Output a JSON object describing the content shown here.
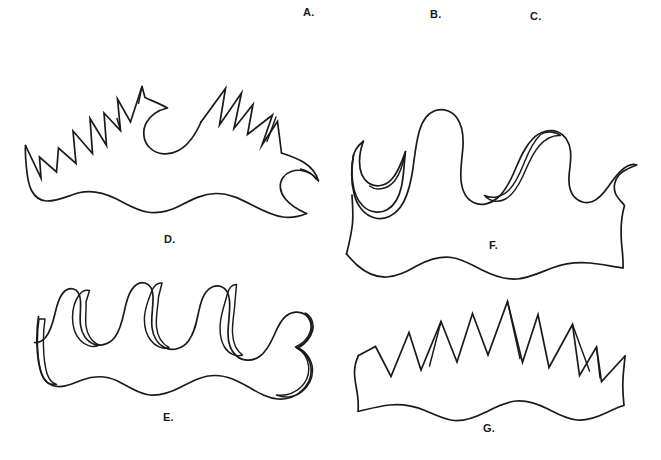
{
  "plate": {
    "background_color": "#ffffff",
    "ink_color": "#1a1a1a",
    "width": 661,
    "height": 460,
    "caption_font_size": 11
  },
  "header_labels": [
    {
      "id": "A",
      "text": "A.",
      "x": 303,
      "y": 7
    },
    {
      "id": "B",
      "text": "B.",
      "x": 430,
      "y": 9
    },
    {
      "id": "C",
      "text": "C.",
      "x": 530,
      "y": 11
    }
  ],
  "figures": [
    {
      "id": "D",
      "label": "D.",
      "label_x": 164,
      "label_y": 234,
      "margin_type": "sharply-serrate",
      "lobe_count": 9,
      "outline_style": "angular-spiked",
      "base_edge": "undulate",
      "bounds": {
        "x": 25,
        "y": 85,
        "width": 295,
        "height": 140
      }
    },
    {
      "id": "E",
      "label": "E.",
      "label_x": 163,
      "label_y": 412,
      "margin_type": "rounded-lobed",
      "lobe_count": 5,
      "outline_style": "smooth-rounded-double-line",
      "base_edge": "undulate",
      "bounds": {
        "x": 38,
        "y": 286,
        "width": 280,
        "height": 120
      }
    },
    {
      "id": "F",
      "label": "F.",
      "label_x": 489,
      "label_y": 240,
      "margin_type": "wavy-lobed",
      "lobe_count": 5,
      "outline_style": "smooth-wavy",
      "base_edge": "undulate",
      "bounds": {
        "x": 353,
        "y": 88,
        "width": 283,
        "height": 142
      }
    },
    {
      "id": "G",
      "label": "G.",
      "label_x": 483,
      "label_y": 423,
      "margin_type": "coarsely-dentate",
      "lobe_count": 7,
      "outline_style": "angular-zigzag",
      "base_edge": "undulate",
      "bounds": {
        "x": 358,
        "y": 300,
        "width": 267,
        "height": 112
      }
    }
  ],
  "paths": {
    "D_outer": "M25.5,145.5 C25.0,152 25.6,159 26.3,166 C27.2,175 27.6,183 31.5,190.5 C35.0,197 40.5,200.8 46.5,201.0 C58.0,201.3 68.5,195.5 79.0,192.8 C92.0,189.5 104.0,192.8 115.5,198.5 C126.0,203.7 135.5,210.0 147.0,212.0 C159.5,214.2 171.0,210.5 181.5,205.0 C192.5,199.3 203.0,193.8 215.5,193.5 C229.0,193.2 240.5,199.0 252.0,205.0 C262.0,210.2 271.5,215.5 283.0,217.0 C291.5,218.1 299.5,216.5 306.5,213.5",
    "D_right_hook": "M306.5,213.5 C299.0,210.2 290.5,205.5 285.0,198.5 C279.5,191.5 278.8,183.5 283.0,177.5 C287.0,171.8 294.5,169.5 301.5,170.5 C309.0,171.6 315.0,175.8 318.5,181.0 C316.5,173.5 311.0,167.0 304.0,162.5 C297.0,158.0 289.0,155.5 281.5,153.0",
    "D_spikes": "M281.5,153.0 L277.5,121.5 L262.0,145.0 L272.5,115.0 L247.5,134.5 L253.0,104.5 L234.0,128.5 L241.5,93.0 L219.5,125.0 L225.5,88.5 L201.0,122.0",
    "D_curl": "M201.0,122.0 C196.0,133.5 189.5,144.5 178.5,150.5 C169.0,155.7 157.5,155.0 150.0,148.0 C143.0,141.4 142.0,130.5 146.5,122.5 C150.8,114.8 159.0,110.0 167.5,108.0 C160.5,104.0 152.5,101.0 145.0,97.5 L142.0,86.5",
    "D_spikes_left": "M142.0,86.5 L130.5,122.0 L117.5,99.0 L120.5,130.5 L104.0,113.0 L106.5,145.5 L90.0,118.5 L92.5,153.5 L73.0,131.0 L76.0,163.5 L58.5,148.0 L56.5,172.0 L39.5,157.0 L41.0,178.0 L25.5,145.5",
    "D_detail_1": "M142.0,86.5 L138.5,103.5",
    "D_detail_2": "M120.5,130.5 L117.0,118.5",
    "D_detail_3": "M276.0,117.0 L267.0,141.5",
    "D_detail_4": "M300.5,169.0 C307.5,170.5 313.0,174.5 316.5,179.5",
    "E_outer": "M38.5,316.5 C37.0,326 36.6,336 37.0,345.5 C37.4,355 38.2,364 41.0,372.5 C43.0,378.6 46.5,383.5 52.5,385.5 C62.5,388.8 72.5,383.5 82.0,380.0 C94.0,375.6 106.0,375.5 117.5,381.0 C127.5,385.8 136.0,392.5 147.0,394.5 C159.0,396.7 170.5,392.5 181.0,387.0 C192.0,381.2 202.5,375.5 215.0,375.5 C227.5,375.5 238.0,381.0 248.5,387.0 C258.0,392.4 267.0,398.0 278.0,399.0 C287.0,399.8 295.5,396.5 302.0,390.5 C308.5,384.5 312.0,376.0 311.0,367.5 C310.0,359.0 304.5,352.0 297.0,348.0 C303.0,344.5 308.5,339.5 311.0,333.0 C313.5,326.5 311.5,319.0 306.0,315.0 C300.0,310.6 291.5,311.5 286.0,316.0 C280.0,320.9 277.0,328.5 274.0,335.5 C270.5,343.5 266.5,351.5 259.5,356.5 C252.5,361.5 243.0,361.5 236.5,356.0 C230.0,350.5 228.0,341.5 228.0,333.5 C228.0,322.5 230.5,311.5 229.5,300.5 C229.0,294.5 226.5,288.5 221.0,286.5 C215.5,284.5 209.5,287.5 206.0,292.0 C201.5,297.8 200.0,305.5 198.5,312.5 C196.5,322.5 194.5,333.0 188.5,341.0 C183.0,348.3 173.5,351.5 165.5,348.0 C157.5,344.5 153.0,336.0 152.0,327.5 C150.8,317.0 153.5,306.5 153.0,296.0 C152.7,290.5 150.5,284.5 145.0,283.0 C139.5,281.5 134.5,285.5 131.5,290.0 C127.5,296.0 126.0,303.5 124.5,310.5 C122.5,319.8 120.5,329.5 115.0,337.0 C110.0,343.8 101.0,347.0 93.5,344.0 C86.0,341.0 81.5,333.0 80.5,325.0 C79.5,317.0 81.0,309.0 80.5,301.0 C80.2,296.0 78.5,290.5 73.5,289.0 C68.5,287.5 64.0,291.0 61.5,295.0 C58.0,300.5 56.5,307.0 55.0,313.5 C53.0,322.0 51.0,331.0 45.5,337.5 C42.5,341.0 38.5,343.0 34.5,342.5",
    "E_inner": "M45.0,319.0 C43.5,328.5 43.2,338.0 43.5,347.5 C43.8,356.5 44.5,365.5 47.0,373.5 C48.8,379.0 51.5,383.0 56.5,384.5 C49.5,385.5 44.5,381.0 42.0,374.5 C39.0,366.5 38.0,357.0 37.6,348.0 C37.2,338.5 37.6,328.5 39.0,319.0 Z M86.0,302.0 C86.5,310.0 85.0,318.0 86.0,326.0 C87.0,334.0 91.5,342.0 99.0,345.0 C93.0,348.5 85.0,345.5 80.0,340.0 C74.5,334.0 72.5,325.5 72.5,317.5 C72.5,309.5 74.5,301.5 79.0,295.0 C81.5,291.5 85.5,289.5 89.5,290.5 Z M158.5,297.0 C158.0,307.0 155.5,317.0 156.5,327.0 C157.4,335.5 161.5,343.5 169.0,347.5 C162.5,350.0 155.0,346.0 150.5,340.0 C145.5,333.5 144.0,324.5 144.5,316.5 C145.0,307.5 148.5,299.0 152.0,290.5 C154.0,286.0 157.5,282.5 162.0,283.0 Z M235.0,301.5 C234.5,312.0 232.0,322.5 232.5,333.0 C232.9,341.5 235.5,350.0 242.5,355.0 C236.0,357.5 228.5,353.5 224.5,347.0 C220.0,339.5 219.5,330.0 220.5,321.5 C221.6,312.0 225.0,303.0 227.5,293.5 C228.9,288.5 232.0,284.5 236.5,284.5 Z M306.5,315.5 C311.0,320.5 312.0,327.5 309.5,333.5 C307.0,339.5 301.5,344.0 295.5,347.0 C302.5,350.5 307.5,357.5 308.5,365.5 C309.5,373.5 306.5,382.0 300.5,387.5 C294.0,393.5 285.0,396.0 276.5,395.0 C284.5,398.5 294.0,397.5 301.0,392.5 C308.5,387.0 313.0,378.0 312.5,369.0 C312.0,360.0 306.5,352.0 298.5,348.0 C305.0,344.0 310.5,338.0 312.5,331.0 C314.5,324.0 311.5,316.0 305.0,313.0 Z",
    "F_outer": "M353.5,155.0 C352.0,163.5 351.5,172.5 352.5,181.0 C353.5,190.5 356.5,200.0 363.5,206.5 C370.0,212.5 380.0,214.0 387.5,209.5 C395.5,204.8 399.5,195.5 401.5,186.5 C404.0,175.0 404.0,163.0 405.5,151.5 C402.0,161.5 398.5,172.0 391.5,179.5 C385.5,185.9 375.5,188.0 368.5,183.0 C362.0,178.4 359.5,169.5 359.5,161.5 C359.5,154.5 361.0,147.5 363.5,141.0 C360.5,143.5 357.5,146.5 355.5,150.0 Z",
    "F_body": "M353.5,155.0 C351.0,168.5 350.8,182.5 354.5,195.5 C357.5,206.0 364.5,215.5 375.0,218.0 C385.0,220.4 394.5,215.0 400.5,207.0 C407.0,198.3 409.5,187.5 411.5,177.0 C414.5,161.5 415.0,145.5 419.5,130.5 C422.0,122.0 427.0,113.5 435.5,110.5 C443.5,107.7 452.5,111.5 457.0,118.0 C462.5,125.9 463.5,136.0 463.0,145.5 C462.4,157.0 460.0,168.5 461.0,180.0 C461.8,189.0 465.5,198.5 473.5,202.5 C481.5,206.5 491.0,203.5 497.5,198.0 C505.0,191.6 509.5,182.5 513.5,173.5 C519.0,161.2 523.5,148.0 533.0,138.5 C539.5,132.0 549.5,128.5 558.0,132.0 C565.5,135.1 569.5,143.0 570.5,151.0 C571.6,159.5 569.5,168.0 569.0,176.5 C568.6,183.5 569.5,191.0 574.0,196.5 C578.5,202.0 586.0,204.0 592.5,201.5 C600.0,198.6 605.0,191.5 609.5,185.0 C614.5,177.8 619.5,170.0 627.5,166.0 C630.5,164.5 634.0,163.8 636.5,165.0",
    "F_right": "M636.5,165.0 C630.5,167.5 623.5,170.0 619.0,175.0 C614.5,180.0 613.0,187.5 615.5,193.5 C617.5,198.3 621.5,201.5 624.5,205.5 C621.0,217.5 620.5,230.0 621.5,242.5 C622.2,251.0 623.5,259.5 623.0,268.0",
    "F_bottom": "M623.0,268.0 C612.0,266.5 601.0,264.0 590.0,263.0 C577.0,261.8 564.0,263.5 552.0,268.0 C540.5,272.3 529.5,278.0 517.0,279.0 C504.5,280.0 493.0,275.5 482.0,270.0 C472.0,265.0 462.5,259.0 451.5,257.5 C439.5,255.9 428.0,260.0 417.5,265.5 C407.5,270.7 398.0,276.5 386.5,277.0 C375.5,277.5 365.5,272.5 357.5,265.5 C353.5,262.0 350.0,258.0 346.5,254.0",
    "F_base_left": "M346.5,254.0 C349.0,244.0 351.5,234.0 352.5,223.5 C353.4,214.0 352.5,204.5 352.0,195.0",
    "F_inner_1": "M405.5,151.5 C403.5,162.0 401.0,173.0 394.5,181.0 C388.0,189.0 377.0,191.5 369.5,186.0",
    "F_inner_2": "M540.5,134.5 C533.0,142.0 528.5,152.0 524.5,162.0 C520.5,172.0 516.5,182.5 509.0,190.0 C502.5,196.5 492.5,199.5 484.5,195.5 C489.5,201.5 498.5,203.0 505.5,199.0 C513.5,194.4 518.5,185.5 522.5,177.0 C527.5,166.2 531.5,154.5 539.5,145.5 C545.0,139.3 552.5,135.0 560.5,135.5 C554.5,131.0 546.0,131.0 540.5,134.5 Z",
    "G_outer": "M358.5,355.5 C356.0,360.5 354.5,366.5 354.5,372.5 C354.5,380.0 356.5,387.5 357.5,395.0 C358.2,400.5 358.5,406.0 358.0,411.5 C368.5,409.0 379.0,406.0 390.0,405.0 C402.0,403.9 414.0,406.0 425.0,410.5 C434.5,414.4 443.5,419.5 454.0,420.5 C465.5,421.6 476.0,417.0 486.0,412.0 C495.5,407.2 505.0,402.0 516.0,401.0 C527.5,399.9 538.0,404.0 548.0,409.0 C557.5,413.8 566.5,419.0 577.0,420.0 C587.5,421.0 597.5,417.0 607.0,412.5 C612.5,409.9 618.0,407.0 624.0,405.5 C623.0,396.5 622.5,387.5 623.0,378.5 C623.4,371.0 624.5,363.5 625.0,356.0",
    "G_spikes": "M625.0,356.0 L601.5,381.5 L596.5,347.0 L579.5,375.5 L572.5,324.5 L549.0,367.5 L538.0,314.5 L522.5,362.5 L507.5,301.5 L488.0,355.0 L472.5,313.5 L457.0,362.0 L441.0,321.5 L421.0,370.0 L409.0,332.5 L391.0,376.5 L375.5,346.5 L358.5,355.5",
    "G_detail_1": "M572.5,324.5 L589.5,371.0",
    "G_detail_2": "M507.5,301.5 L520.0,358.5",
    "G_detail_3": "M441.0,321.5 L429.5,366.0",
    "G_detail_4": "M596.5,347.0 L600.0,378.0"
  }
}
